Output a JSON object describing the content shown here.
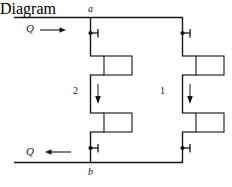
{
  "figure": {
    "type": "fluid-circuit-schematic",
    "line_color": "#16161a",
    "box_fill": "#ffffff",
    "background": "#ffffff"
  },
  "labels": {
    "node_top": "a",
    "node_bottom": "b",
    "flow_in": "Q",
    "flow_out": "Q",
    "branch_left": "2",
    "branch_right": "1",
    "edge_mark": ""
  },
  "arrows": {
    "inlet": {
      "label": "Q",
      "direction": "right"
    },
    "outlet": {
      "label": "Q",
      "direction": "left"
    },
    "branch_left_flow": {
      "direction": "down"
    },
    "branch_right_flow": {
      "direction": "down"
    }
  },
  "valves": [
    {
      "name": "valve-top-left",
      "branch": "2",
      "position": "top"
    },
    {
      "name": "valve-top-right",
      "branch": "1",
      "position": "top"
    },
    {
      "name": "valve-bottom-left",
      "branch": "2",
      "position": "bottom"
    },
    {
      "name": "valve-bottom-right",
      "branch": "1",
      "position": "bottom"
    }
  ],
  "components": [
    {
      "name": "component-left-upper",
      "branch": "2",
      "position": "upper"
    },
    {
      "name": "component-left-lower",
      "branch": "2",
      "position": "lower"
    },
    {
      "name": "component-right-upper",
      "branch": "1",
      "position": "upper"
    },
    {
      "name": "component-right-lower",
      "branch": "1",
      "position": "lower"
    }
  ]
}
